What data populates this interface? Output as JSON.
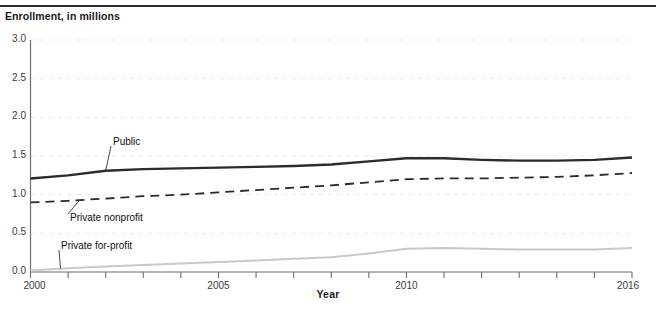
{
  "figure": {
    "y_axis_title": "Enrollment, in millions",
    "x_axis_title": "Year"
  },
  "annotations": {
    "public": "Public",
    "private_nonprofit": "Private nonprofit",
    "private_for_profit": "Private for-profit"
  },
  "colors": {
    "public_line": "#2b2b2b",
    "private_nonprofit_line": "#2b2b2b",
    "private_for_profit_line": "#c9c9c9",
    "axis": "#6e6e6e",
    "gridline": "#ededed",
    "text": "#1a1a1a"
  },
  "chart_data": {
    "type": "line",
    "title": "",
    "subtitle": "",
    "xlabel": "Year",
    "ylabel": "Enrollment, in millions",
    "xlim": [
      2000,
      2016
    ],
    "ylim": [
      0.0,
      3.0
    ],
    "ytick_labels": [
      "0.0",
      "0.5",
      "1.0",
      "1.5",
      "2.0",
      "2.5",
      "3.0"
    ],
    "ytick_values": [
      0.0,
      0.5,
      1.0,
      1.5,
      2.0,
      2.5,
      3.0
    ],
    "xtick_values": [
      2000,
      2001,
      2002,
      2003,
      2004,
      2005,
      2006,
      2007,
      2008,
      2009,
      2010,
      2011,
      2012,
      2013,
      2014,
      2015,
      2016
    ],
    "xtick_labels_shown": [
      "2000",
      "2005",
      "2010",
      "2016"
    ],
    "xtick_labels_shown_values": [
      2000,
      2005,
      2010,
      2016
    ],
    "grid": true,
    "grid_axis": "y",
    "legend": "inline-annotations",
    "x": [
      2000,
      2001,
      2002,
      2003,
      2004,
      2005,
      2006,
      2007,
      2008,
      2009,
      2010,
      2011,
      2012,
      2013,
      2014,
      2015,
      2016
    ],
    "series": [
      {
        "name": "Public",
        "style": "solid",
        "width": 2.4,
        "color": "#2b2b2b",
        "values": [
          1.21,
          1.25,
          1.31,
          1.33,
          1.34,
          1.35,
          1.36,
          1.37,
          1.39,
          1.43,
          1.47,
          1.47,
          1.45,
          1.44,
          1.44,
          1.45,
          1.48
        ]
      },
      {
        "name": "Private nonprofit",
        "style": "dashed",
        "width": 1.8,
        "color": "#2b2b2b",
        "values": [
          0.9,
          0.92,
          0.95,
          0.98,
          1.0,
          1.03,
          1.06,
          1.09,
          1.12,
          1.16,
          1.2,
          1.21,
          1.21,
          1.22,
          1.23,
          1.25,
          1.28
        ]
      },
      {
        "name": "Private for-profit",
        "style": "solid",
        "width": 2.0,
        "color": "#c9c9c9",
        "values": [
          0.02,
          0.05,
          0.07,
          0.09,
          0.11,
          0.13,
          0.15,
          0.17,
          0.19,
          0.24,
          0.3,
          0.31,
          0.3,
          0.29,
          0.29,
          0.29,
          0.31
        ]
      }
    ],
    "annotations": [
      {
        "text": "Public",
        "series": "Public",
        "at_x": 2002.0,
        "label_x": 113,
        "label_y": 136
      },
      {
        "text": "Private nonprofit",
        "series": "Private nonprofit",
        "at_x": 2001.3,
        "label_x": 70,
        "label_y": 212
      },
      {
        "text": "Private for-profit",
        "series": "Private for-profit",
        "at_x": 2000.8,
        "label_x": 61,
        "label_y": 240
      }
    ]
  }
}
